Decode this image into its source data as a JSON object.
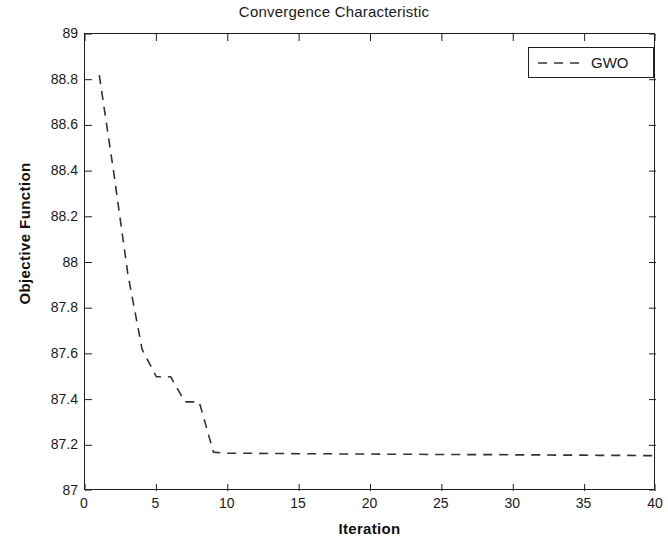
{
  "chart_data": {
    "type": "line",
    "title": "Convergence Characteristic",
    "xlabel": "Iteration",
    "ylabel": "Objective Function",
    "xlim": [
      0,
      40
    ],
    "ylim": [
      87,
      89
    ],
    "grid": false,
    "legend_position": "top-right",
    "xticks": [
      0,
      5,
      10,
      15,
      20,
      25,
      30,
      35,
      40
    ],
    "xtick_labels": [
      "0",
      "5",
      "10",
      "15",
      "20",
      "25",
      "30",
      "35",
      "40"
    ],
    "yticks": [
      87,
      87.2,
      87.4,
      87.6,
      87.8,
      88,
      88.2,
      88.4,
      88.6,
      88.8,
      89
    ],
    "ytick_labels": [
      "87",
      "87.2",
      "87.4",
      "87.6",
      "87.8",
      "88",
      "88.2",
      "88.4",
      "88.6",
      "88.8",
      "89"
    ],
    "line_style": "dashed",
    "line_color": "#333333",
    "series": [
      {
        "name": "GWO",
        "x": [
          1,
          2,
          3,
          4,
          5,
          6,
          7,
          8,
          9,
          10,
          11,
          12,
          13,
          14,
          15,
          16,
          17,
          18,
          19,
          20,
          21,
          22,
          23,
          24,
          25,
          26,
          27,
          28,
          29,
          30,
          31,
          32,
          33,
          34,
          35,
          36,
          37,
          38,
          39,
          40
        ],
        "values": [
          88.82,
          88.4,
          87.95,
          87.62,
          87.5,
          87.5,
          87.39,
          87.39,
          87.17,
          87.165,
          87.165,
          87.165,
          87.164,
          87.164,
          87.163,
          87.163,
          87.163,
          87.162,
          87.162,
          87.162,
          87.161,
          87.161,
          87.161,
          87.16,
          87.16,
          87.16,
          87.159,
          87.159,
          87.159,
          87.158,
          87.158,
          87.158,
          87.157,
          87.157,
          87.157,
          87.156,
          87.156,
          87.156,
          87.155,
          87.155
        ]
      }
    ]
  },
  "legend": {
    "entries": [
      {
        "label": "GWO",
        "style": "dashed",
        "color": "#333333"
      }
    ]
  }
}
